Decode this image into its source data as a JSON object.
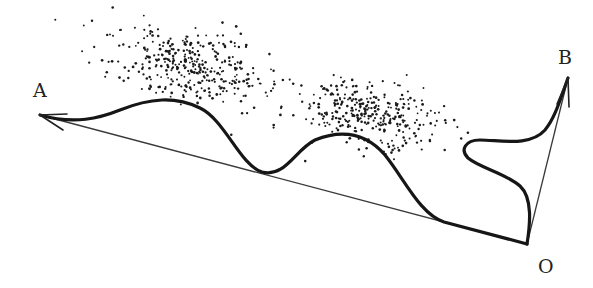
{
  "diagram": {
    "labels": {
      "a": {
        "text": "A",
        "x": 33,
        "y": 81
      },
      "b": {
        "text": "B",
        "x": 558,
        "y": 48
      },
      "o": {
        "text": "O",
        "x": 538,
        "y": 257
      }
    },
    "points": {
      "origin": [
        527,
        244
      ],
      "a_tip": [
        40,
        115
      ],
      "b_tip": [
        568,
        78
      ]
    },
    "colors": {
      "background": "#ffffff",
      "curve": "#161616",
      "line": "#3a3a3a",
      "dot": "#1a1a1a"
    },
    "clusters": [
      {
        "name": "upper-left-cluster",
        "cx": 190,
        "cy": 65,
        "rx": 95,
        "ry": 40,
        "tilt": 0.18,
        "count": 360,
        "seed": 7
      },
      {
        "name": "middle-cluster",
        "cx": 370,
        "cy": 115,
        "rx": 95,
        "ry": 38,
        "tilt": 0.15,
        "count": 320,
        "seed": 13
      }
    ]
  }
}
